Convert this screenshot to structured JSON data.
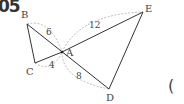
{
  "problem": {
    "number": "05",
    "answer_bracket": "("
  },
  "diagram": {
    "points": {
      "B": {
        "label": "B",
        "x": 27,
        "y": 24
      },
      "A": {
        "label": "A",
        "x": 62,
        "y": 52
      },
      "C": {
        "label": "C",
        "x": 35,
        "y": 63
      },
      "D": {
        "label": "D",
        "x": 109,
        "y": 89
      },
      "E": {
        "label": "E",
        "x": 143,
        "y": 12
      }
    },
    "segments": [
      "B-C",
      "C-A",
      "B-D",
      "C-E",
      "E-D"
    ],
    "lengths": {
      "AB": "6",
      "AE": "12",
      "AC": "4",
      "AD": "8"
    },
    "colors": {
      "line": "#333333",
      "arc": "#999999",
      "text": "#444444"
    }
  }
}
